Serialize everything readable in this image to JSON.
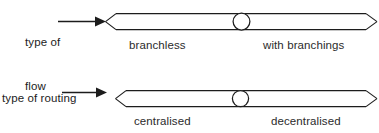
{
  "canvas": {
    "width": 379,
    "height": 133,
    "background": "#ffffff",
    "stroke": "#1c1c1c",
    "text_color": "#2b2b2b"
  },
  "diagram": {
    "type": "bipolar-scale-diagram",
    "rows": [
      {
        "id": "type-of-flow",
        "label_lines": [
          "type of",
          "flow"
        ],
        "pointer_arrow": "right-arrow",
        "left_endpoint": "branchless",
        "right_endpoint": "with branchings",
        "marker": "circle",
        "marker_position_pct": 50
      },
      {
        "id": "type-of-routing-decisions-evaluation",
        "label_lines": [
          "type of routing",
          "decisions",
          "evaluation"
        ],
        "pointer_arrow": "right-arrow",
        "left_endpoint": "centralised",
        "right_endpoint": "decentralised",
        "marker": "circle",
        "marker_position_pct": 48
      }
    ]
  }
}
